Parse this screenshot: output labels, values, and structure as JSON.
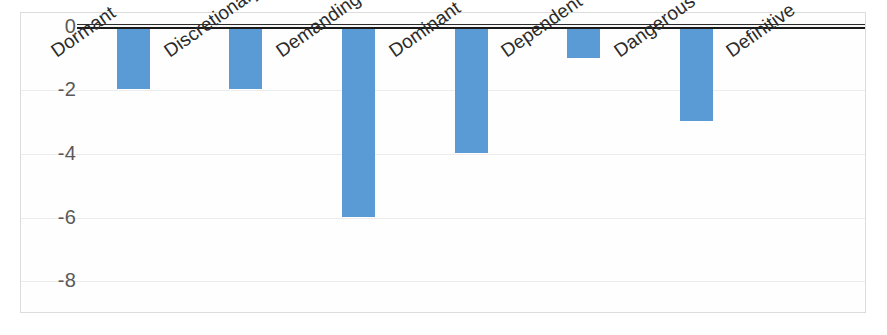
{
  "chart_data": {
    "type": "bar",
    "title": "",
    "subtitle": "",
    "xlabel": "",
    "ylabel": "",
    "orientation": "vertical",
    "grid": true,
    "legend": false,
    "legend_position": "none",
    "bar_color": "#5B9BD5",
    "axis_line_color": "#1a1a1a",
    "gridline_color": "#ececec",
    "plot_border_color": "#dcdcdc",
    "tick_label_color": "#595959",
    "category_label_color": "#2b2b2b",
    "category_label_rotation_deg": -35,
    "ylim": [
      -9,
      0.4
    ],
    "yticks": [
      0,
      -2,
      -4,
      -6,
      -8
    ],
    "ytick_labels": [
      "0",
      "-2",
      "-4",
      "-6",
      "-8"
    ],
    "categories": [
      "Dormant",
      "Discretionary",
      "Demanding",
      "Dominant",
      "Dependent",
      "Dangerous",
      "Definitive"
    ],
    "values": [
      -2,
      -2,
      -6,
      -4,
      -1,
      -3,
      0
    ],
    "series": [
      {
        "name": "Series 1",
        "values": [
          -2,
          -2,
          -6,
          -4,
          -1,
          -3,
          0
        ]
      }
    ]
  }
}
